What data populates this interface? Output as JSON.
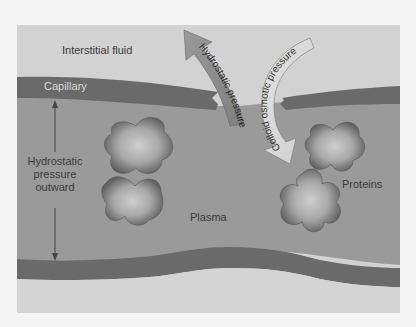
{
  "diagram": {
    "labels": {
      "interstitial_fluid": "Interstitial fluid",
      "capillary": "Capillary",
      "hydrostatic_outward_line1": "Hydrostatic",
      "hydrostatic_outward_line2": "pressure",
      "hydrostatic_outward_line3": "outward",
      "plasma": "Plasma",
      "proteins": "Proteins"
    },
    "arrows": {
      "hydrostatic_pressure": "Hydrostatic pressure",
      "colloid_osmotic_pressure": "Colloid osmotic pressure"
    },
    "colors": {
      "page_background": "#f4f4f4",
      "interstitial_fluid": "#d2d2d2",
      "capillary_wall": "#6a6a6a",
      "plasma": "#9a9a9a",
      "protein_edge": "#5a5a5a",
      "protein_center": "#c8c8c8",
      "hydrostatic_arrow": "#8c8c8c",
      "colloid_arrow": "#dcdcdc"
    }
  }
}
